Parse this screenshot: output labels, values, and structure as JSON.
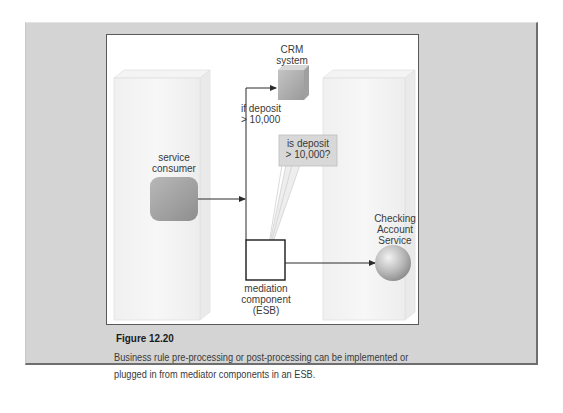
{
  "figure": {
    "number_label": "Figure 12.20",
    "caption_line1": "Business rule pre-processing or post-processing can be implemented or",
    "caption_line2": "plugged in from mediator components in an ESB."
  },
  "diagram": {
    "nodes": {
      "service_consumer": {
        "line1": "service",
        "line2": "consumer"
      },
      "mediation_component": {
        "line1": "mediation",
        "line2": "component",
        "line3": "(ESB)"
      },
      "crm_system": {
        "line1": "CRM",
        "line2": "system"
      },
      "checking_account_service": {
        "line1": "Checking",
        "line2": "Account",
        "line3": "Service"
      }
    },
    "edge_labels": {
      "crm_condition": {
        "line1": "if deposit",
        "line2": "> 10,000"
      }
    },
    "callout": {
      "line1": "is deposit",
      "line2": "> 10,000?"
    }
  },
  "colors": {
    "panel_bg": "#d4d4d4",
    "canvas_bg": "#ffffff",
    "node_gray": "#a8a8a8",
    "line": "#2a2a2a"
  }
}
